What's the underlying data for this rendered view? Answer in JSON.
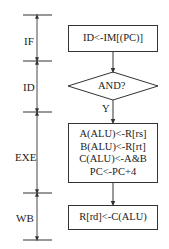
{
  "stages": [
    {
      "label": "IF"
    },
    {
      "label": "ID"
    },
    {
      "label": "EXE"
    },
    {
      "label": "WB"
    }
  ],
  "flow": {
    "fetch_box": {
      "text": "ID<-IM[(PC)]"
    },
    "decision": {
      "text": "AND?",
      "yes_label": "Y"
    },
    "execute_box": {
      "lines": [
        "A(ALU)<-R[rs]",
        "B(ALU)<-R[rt]",
        "C(ALU)<-A&B",
        "PC<-PC+4"
      ]
    },
    "writeback_box": {
      "text": "R[rd]<-C(ALU)"
    }
  },
  "colors": {
    "line": "#333333",
    "text": "#222222",
    "background": "#ffffff"
  }
}
